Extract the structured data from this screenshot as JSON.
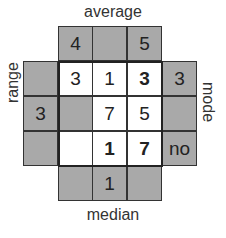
{
  "labels": {
    "top": "average",
    "bottom": "median",
    "left": "range",
    "right": "mode"
  },
  "top_row": [
    "4",
    "",
    "5"
  ],
  "bottom_row": [
    "",
    "1",
    ""
  ],
  "left_col": [
    "",
    "3",
    ""
  ],
  "right_col": [
    "3",
    "",
    "no"
  ],
  "grid": [
    [
      {
        "value": "3",
        "bold": false
      },
      {
        "value": "1",
        "bold": false
      },
      {
        "value": "3",
        "bold": true
      }
    ],
    [
      {
        "value": "",
        "bold": false,
        "shaded": true
      },
      {
        "value": "7",
        "bold": false
      },
      {
        "value": "5",
        "bold": false
      }
    ],
    [
      {
        "value": "",
        "bold": false
      },
      {
        "value": "1",
        "bold": true
      },
      {
        "value": "7",
        "bold": true
      }
    ]
  ],
  "colors": {
    "shade": "#a9a9a9",
    "border": "#333333",
    "background": "#ffffff"
  }
}
